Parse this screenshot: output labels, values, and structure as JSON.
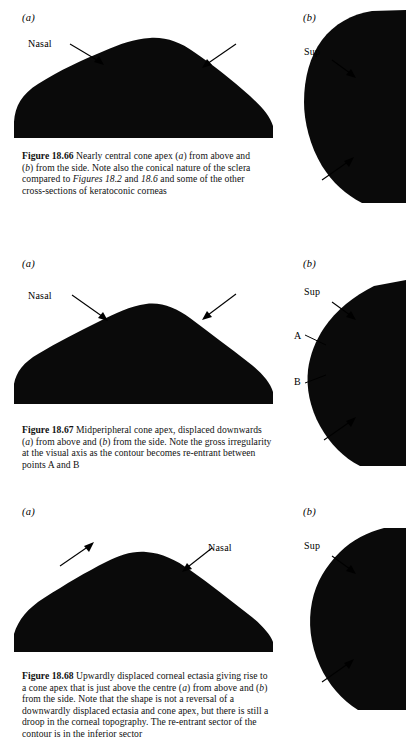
{
  "figures": [
    {
      "id": "fig-18-66",
      "panel_a_label": "(a)",
      "panel_b_label": "(b)",
      "annotations_a": [
        "Nasal"
      ],
      "annotations_b": [
        "Sup"
      ],
      "caption_number": "Figure 18.66",
      "caption_text_1": " Nearly central cone apex (",
      "caption_italic_1": "a",
      "caption_text_2": ") from above and (",
      "caption_italic_2": "b",
      "caption_text_3": ") from the side. Note also the conical nature of the sclera compared to ",
      "caption_italic_3": "Figures 18.2",
      "caption_text_4": " and ",
      "caption_italic_4": "18.6",
      "caption_text_5": " and some of the other cross-sections of keratoconic corneas"
    },
    {
      "id": "fig-18-67",
      "panel_a_label": "(a)",
      "panel_b_label": "(b)",
      "annotations_a": [
        "Nasal"
      ],
      "annotations_b": [
        "Sup",
        "A",
        "B"
      ],
      "caption_number": "Figure 18.67",
      "caption_text_1": " Midperipheral cone apex, displaced downwards (",
      "caption_italic_1": "a",
      "caption_text_2": ") from above and (",
      "caption_italic_2": "b",
      "caption_text_3": ") from the side. Note the gross irregularity at the visual axis as the contour becomes re-entrant between points A and B",
      "caption_italic_3": "",
      "caption_text_4": "",
      "caption_italic_4": "",
      "caption_text_5": ""
    },
    {
      "id": "fig-18-68",
      "panel_a_label": "(a)",
      "panel_b_label": "(b)",
      "annotations_a": [
        "Nasal"
      ],
      "annotations_b": [
        "Sup"
      ],
      "caption_number": "Figure 18.68",
      "caption_text_1": " Upwardly displaced corneal ectasia giving rise to a cone apex that is just above the centre (",
      "caption_italic_1": "a",
      "caption_text_2": ") from above and (",
      "caption_italic_2": "b",
      "caption_text_3": ") from the side. Note that the shape is not a reversal of a downwardly displaced ectasia and cone apex, but there is still a droop in the corneal topography. The re-entrant sector of the contour is in the inferior sector",
      "caption_italic_3": "",
      "caption_text_4": "",
      "caption_italic_4": "",
      "caption_text_5": ""
    }
  ],
  "colors": {
    "ink": "#000000",
    "page": "#ffffff",
    "silhouette": "#0a0a0a"
  }
}
